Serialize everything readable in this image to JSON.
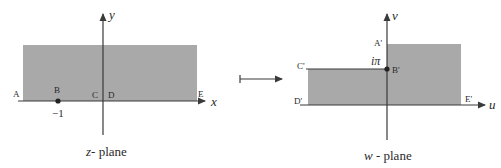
{
  "colors": {
    "shade": "#a9a9a9",
    "line": "#3a3a3a",
    "text": "#2a2a2a",
    "background": "#ffffff"
  },
  "z_plane": {
    "caption_var": "z",
    "caption_rest": "- plane",
    "axis_x_label": "x",
    "axis_y_label": "y",
    "points": {
      "A": "A",
      "B": "B",
      "C": "C",
      "D": "D",
      "E": "E"
    },
    "tick_label_B": "−1"
  },
  "mapping_arrow": {
    "icon": "mapsto-arrow-icon"
  },
  "w_plane": {
    "caption_var": "w",
    "caption_rest": " - plane",
    "axis_u_label": "u",
    "axis_v_label": "v",
    "points": {
      "A": "A'",
      "B": "B'",
      "C": "C'",
      "D": "D'",
      "E": "E'"
    },
    "value_label_B": "iπ"
  }
}
